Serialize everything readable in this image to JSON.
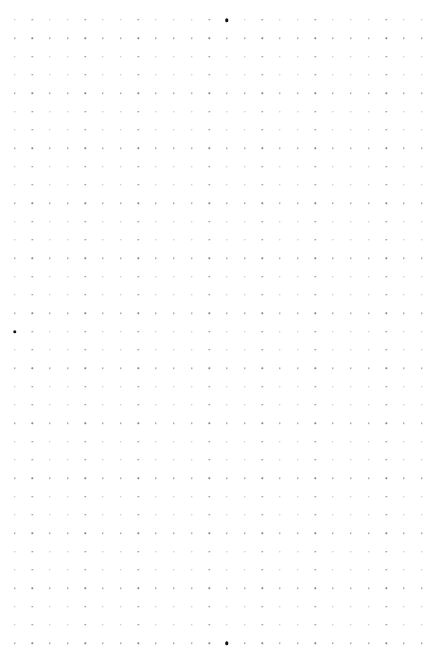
{
  "page": {
    "background": "#ffffff",
    "width": 432,
    "height": 664
  },
  "dot_grid": {
    "columns": 24,
    "rows": 35,
    "origin_x": 14.5,
    "origin_y": 20,
    "spacing_x": 17.7,
    "spacing_y": 18.33,
    "dot_color": "#8a8a8a",
    "marker_color": "#111111",
    "markers": [
      {
        "row": 0,
        "col": 12
      },
      {
        "row": 17,
        "col": 0
      },
      {
        "row": 34,
        "col": 12
      }
    ]
  }
}
